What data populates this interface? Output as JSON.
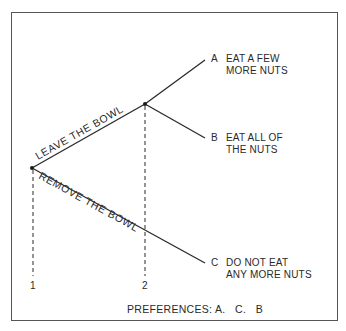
{
  "diagram": {
    "type": "decision-tree",
    "colors": {
      "line": "#2a2a2a",
      "border": "#555555",
      "background": "#ffffff"
    },
    "nodes": [
      {
        "id": "1",
        "label": "1"
      },
      {
        "id": "2",
        "label": "2"
      }
    ],
    "branches": {
      "leave": "LEAVE THE BOWL",
      "remove": "REMOVE THE BOWL"
    },
    "outcomes": [
      {
        "letter": "A",
        "line1": "EAT A FEW",
        "line2": "MORE NUTS"
      },
      {
        "letter": "B",
        "line1": "EAT ALL OF",
        "line2": "THE NUTS"
      },
      {
        "letter": "C",
        "line1": "DO NOT EAT",
        "line2": "ANY MORE NUTS"
      }
    ],
    "preferences": "PREFERENCES: A.   C.   B"
  }
}
